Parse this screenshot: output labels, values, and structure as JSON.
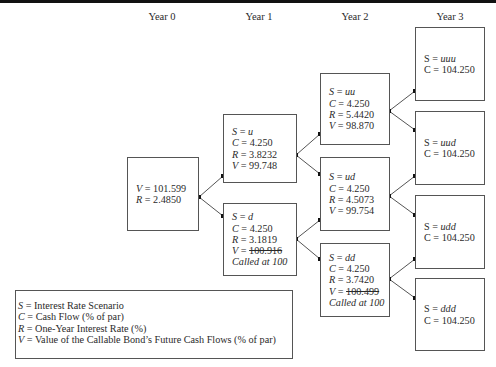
{
  "years": [
    "Year 0",
    "Year 1",
    "Year 2",
    "Year 3"
  ],
  "nodes": {
    "root": {
      "V_label": "V",
      "V": "101.599",
      "R_label": "R",
      "R": "2.4850"
    },
    "u": {
      "S": "u",
      "C": "4.250",
      "R": "3.8232",
      "V": "99.748"
    },
    "d": {
      "S": "d",
      "C": "4.250",
      "R": "3.1819",
      "V": "100.916",
      "V_struck": true,
      "note": "Called at 100"
    },
    "uu": {
      "S": "uu",
      "C": "4.250",
      "R": "5.4420",
      "V": "98.870"
    },
    "ud": {
      "S": "ud",
      "C": "4.250",
      "R": "4.5073",
      "V": "99.754"
    },
    "dd": {
      "S": "dd",
      "C": "4.250",
      "R": "3.7420",
      "V": "100.499",
      "V_struck": true,
      "note": "Called at 100"
    },
    "uuu": {
      "S": "uuu",
      "C": "104.250"
    },
    "uud": {
      "S": "uud",
      "C": "104.250"
    },
    "udd": {
      "S": "udd",
      "C": "104.250"
    },
    "ddd": {
      "S": "ddd",
      "C": "104.250"
    }
  },
  "labels": {
    "S": "S",
    "C": "C",
    "R": "R",
    "V": "V",
    "eq": " = "
  },
  "legend": {
    "items": [
      {
        "sym": "S",
        "text": " = Interest Rate Scenario"
      },
      {
        "sym": "C",
        "text": " = Cash Flow (% of par)"
      },
      {
        "sym": "R",
        "text": " = One-Year Interest Rate (%)"
      },
      {
        "sym": "V",
        "text": " = Value of the Callable Bond’s Future Cash Flows (% of par)"
      }
    ]
  },
  "colors": {
    "line": "#555555",
    "dot": "#111111",
    "text": "#2a2a2a"
  }
}
